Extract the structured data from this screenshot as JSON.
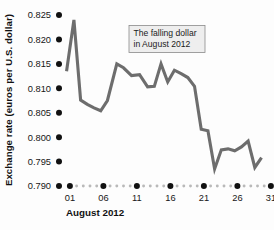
{
  "chart_data": {
    "type": "line",
    "title": "",
    "annotation": {
      "line1": "The falling dollar",
      "line2": "in August 2012"
    },
    "xlabel": "August 2012",
    "ylabel": "Exchange rate (euros per U.S. dollar)",
    "xlim": [
      0,
      31
    ],
    "ylim": [
      0.79,
      0.825
    ],
    "grid": false,
    "legend": null,
    "xticks": [
      "01",
      "06",
      "11",
      "16",
      "21",
      "26",
      "31"
    ],
    "xtick_values": [
      1,
      6,
      11,
      16,
      21,
      26,
      31
    ],
    "yticks": [
      "0.825",
      "0.820",
      "0.815",
      "0.810",
      "0.805",
      "0.800",
      "0.795",
      "0.790"
    ],
    "ytick_values": [
      0.825,
      0.82,
      0.815,
      0.81,
      0.805,
      0.8,
      0.795,
      0.79
    ],
    "series": [
      {
        "name": "Exchange rate (euros per U.S. dollar)",
        "color": "#6d6d6d",
        "x": [
          0.5,
          1.6,
          2.6,
          3.6,
          4.6,
          5.6,
          6.6,
          8.0,
          9.0,
          10.2,
          11.4,
          12.6,
          13.6,
          14.6,
          15.6,
          16.6,
          17.6,
          18.6,
          19.6,
          20.6,
          21.6,
          22.6,
          23.6,
          24.6,
          25.6,
          26.6,
          27.6,
          28.6,
          29.6
        ],
        "y": [
          0.8135,
          0.824,
          0.8076,
          0.8067,
          0.806,
          0.8054,
          0.8075,
          0.815,
          0.8142,
          0.8126,
          0.8128,
          0.8103,
          0.8104,
          0.815,
          0.8113,
          0.8137,
          0.813,
          0.8122,
          0.8104,
          0.8016,
          0.8013,
          0.7935,
          0.7974,
          0.7976,
          0.7972,
          0.798,
          0.7992,
          0.7938,
          0.7958
        ]
      }
    ]
  },
  "axis": {
    "y_label": "Exchange rate (euros per U.S. dollar)",
    "x_label": "August 2012"
  },
  "annotation": {
    "line1": "The falling dollar",
    "line2": "in August 2012"
  },
  "colors": {
    "line": "#6d6d6d",
    "tick_dot": "#111111",
    "minor_dot": "#b9b9b9",
    "annotation_fill": "#eeeeee",
    "annotation_border": "#8a8a8a",
    "background": "#fdfdfd"
  }
}
